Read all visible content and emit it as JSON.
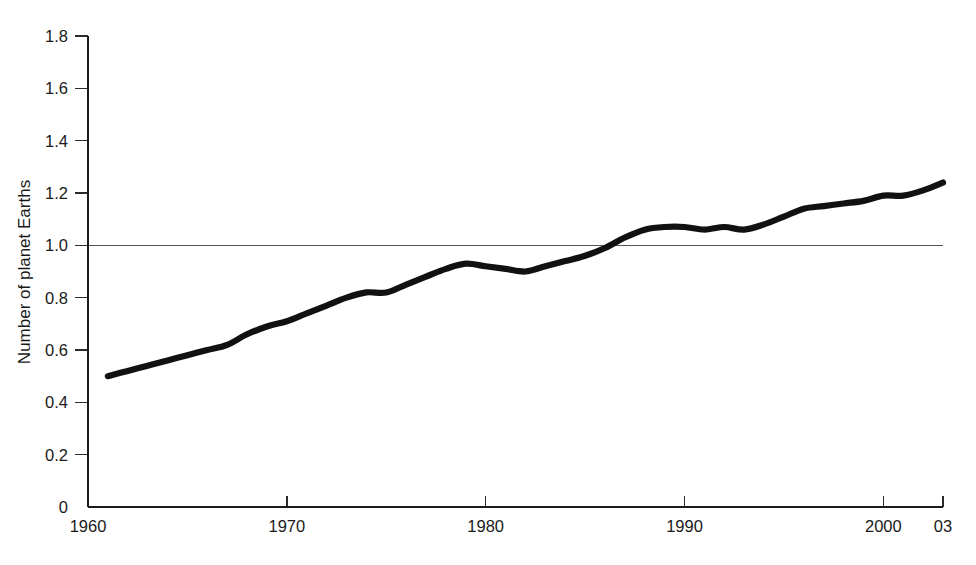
{
  "figure": {
    "background_color": "#ffffff",
    "line_color": "#111111",
    "axis_color": "#1a1a1a",
    "reference_line_color": "#555555"
  },
  "chart_data": {
    "type": "line",
    "title": "",
    "subtitle": "",
    "xlabel": "",
    "ylabel": "Number of planet Earths",
    "xlim": [
      1960,
      2003
    ],
    "ylim": [
      0,
      1.8
    ],
    "grid": false,
    "legend": "none",
    "y_ticks": [
      0,
      0.2,
      0.4,
      0.6,
      0.8,
      1.0,
      1.2,
      1.4,
      1.6,
      1.8
    ],
    "y_tick_labels": [
      "0",
      "0.2",
      "0.4",
      "0.6",
      "0.8",
      "1.0",
      "1.2",
      "1.4",
      "1.6",
      "1.8"
    ],
    "x_ticks": [
      1960,
      1970,
      1980,
      1990,
      2000,
      2003
    ],
    "x_tick_labels": [
      "1960",
      "1970",
      "1980",
      "1990",
      "2000",
      "03"
    ],
    "annotations": [
      {
        "name": "one-earth-reference-line",
        "type": "hline",
        "y": 1.0,
        "label": ""
      }
    ],
    "series": [
      {
        "name": "Number of planet Earths",
        "x": [
          1961,
          1962,
          1963,
          1964,
          1965,
          1966,
          1967,
          1968,
          1969,
          1970,
          1971,
          1972,
          1973,
          1974,
          1975,
          1976,
          1977,
          1978,
          1979,
          1980,
          1981,
          1982,
          1983,
          1984,
          1985,
          1986,
          1987,
          1988,
          1989,
          1990,
          1991,
          1992,
          1993,
          1994,
          1995,
          1996,
          1997,
          1998,
          1999,
          2000,
          2001,
          2002,
          2003
        ],
        "values": [
          0.5,
          0.52,
          0.54,
          0.56,
          0.58,
          0.6,
          0.62,
          0.66,
          0.69,
          0.71,
          0.74,
          0.77,
          0.8,
          0.82,
          0.82,
          0.85,
          0.88,
          0.91,
          0.93,
          0.92,
          0.91,
          0.9,
          0.92,
          0.94,
          0.96,
          0.99,
          1.03,
          1.06,
          1.07,
          1.07,
          1.06,
          1.07,
          1.06,
          1.08,
          1.11,
          1.14,
          1.15,
          1.16,
          1.17,
          1.19,
          1.19,
          1.21,
          1.24
        ]
      }
    ]
  }
}
